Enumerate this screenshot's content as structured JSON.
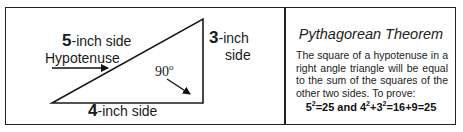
{
  "diagram": {
    "hypotenuse_label": {
      "number": "5",
      "suffix": "-inch side"
    },
    "hypotenuse_name": "Hypotenuse",
    "vertical_side": {
      "number": "3",
      "suffix": "-inch",
      "line2": "side"
    },
    "base_side": {
      "number": "4",
      "suffix": "-inch side"
    },
    "right_angle": {
      "value": "90",
      "unit": "o"
    },
    "triangle": {
      "vertices": [
        [
          52,
          103
        ],
        [
          203,
          19
        ],
        [
          203,
          103
        ]
      ],
      "stroke": "#1a1a1a"
    }
  },
  "panel": {
    "title": "Pythagorean Theorem",
    "description": "The square of a hypotenuse in a right angle triangle will be equal to the sum of the squares of the other two sides.    To prove:",
    "formula": {
      "part1_base": "5",
      "part1_exp": "2",
      "part1_rest": "=25 and ",
      "part2_base": "4",
      "part2_exp": "2",
      "part2_plus": "+",
      "part3_base": "3",
      "part3_exp": "2",
      "part3_rest": "=16+9=25"
    }
  },
  "colors": {
    "border": "#222222",
    "text": "#1a1a1a",
    "background": "#ffffff"
  }
}
